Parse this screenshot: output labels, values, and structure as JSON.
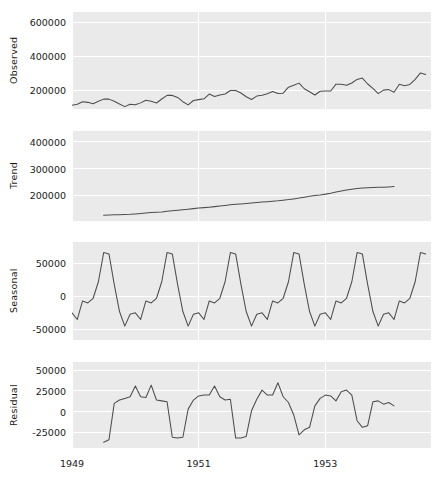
{
  "chart_data": {
    "type": "line",
    "title": "",
    "subtitle": "",
    "xlabel": "",
    "layout": {
      "panels": 4,
      "grid": true,
      "grid_color": "#ffffff",
      "panel_background": "#eaeaea",
      "line_color": "#4d4d4d",
      "legend": "none",
      "figure_background": "#ffffff"
    },
    "x": {
      "tick_labels": [
        "1949",
        "1951",
        "1953"
      ],
      "tick_values": [
        1949,
        1951,
        1953
      ],
      "range": [
        1949.0,
        1954.67
      ],
      "unit": "year",
      "frequency": "monthly",
      "n_points": 68,
      "start": "1949-01",
      "end": "1954-08"
    },
    "panels": [
      {
        "name": "Observed",
        "ylabel": "Observed",
        "ytick_labels": [
          "200000",
          "400000",
          "600000"
        ],
        "ytick_values": [
          200000,
          400000,
          600000
        ],
        "ylim": [
          90000,
          660000
        ],
        "values": [
          112000,
          118000,
          132000,
          129000,
          121000,
          135000,
          148000,
          148000,
          136000,
          119000,
          104000,
          118000,
          115000,
          126000,
          141000,
          135000,
          125000,
          149000,
          170000,
          170000,
          158000,
          133000,
          114000,
          140000,
          145000,
          150000,
          178000,
          163000,
          172000,
          178000,
          199000,
          199000,
          184000,
          162000,
          146000,
          166000,
          171000,
          180000,
          193000,
          181000,
          183000,
          218000,
          230000,
          242000,
          209000,
          191000,
          172000,
          194000,
          196000,
          196000,
          236000,
          235000,
          229000,
          243000,
          264000,
          272000,
          237000,
          211000,
          180000,
          201000,
          204000,
          188000,
          235000,
          227000,
          234000,
          264000,
          302000,
          293000
        ]
      },
      {
        "name": "Trend",
        "ylabel": "Trend",
        "ytick_labels": [
          "200000",
          "300000",
          "400000"
        ],
        "ytick_values": [
          200000,
          300000,
          400000
        ],
        "ylim": [
          105000,
          440000
        ],
        "start_index": 6,
        "end_index": 61,
        "values": [
          126666,
          127250,
          127958,
          128583,
          129000,
          129750,
          131250,
          133083,
          134916,
          136416,
          137416,
          138750,
          140916,
          143166,
          145083,
          147125,
          148916,
          151041,
          153041,
          154791,
          156500,
          158500,
          160875,
          163000,
          165500,
          167125,
          168500,
          170125,
          172000,
          174000,
          175666,
          177000,
          178416,
          180125,
          182541,
          184666,
          187250,
          190250,
          193791,
          197000,
          199750,
          202166,
          205000,
          208666,
          212833,
          216500,
          220250,
          223250,
          225833,
          227666,
          229000,
          229833,
          230333,
          230916,
          231833,
          233083
        ]
      },
      {
        "name": "Seasonal",
        "ylabel": "Seasonal",
        "ytick_labels": [
          "-50000",
          "0",
          "50000"
        ],
        "ytick_values": [
          -50000,
          0,
          50000
        ],
        "ylim": [
          -66000,
          82000
        ],
        "period": 12,
        "pattern": [
          -25000,
          -35000,
          -7000,
          -10000,
          -3000,
          22000,
          66000,
          64000,
          18000,
          -23000,
          -45000,
          -27000
        ],
        "description": "Repeating 12-month seasonal component, peak in July/August, trough in November"
      },
      {
        "name": "Residual",
        "ylabel": "Residual",
        "ytick_labels": [
          "-25000",
          "0",
          "25000",
          "50000"
        ],
        "ytick_values": [
          -25000,
          0,
          25000,
          50000
        ],
        "ylim": [
          -44000,
          60000
        ],
        "start_index": 6,
        "end_index": 61,
        "values": [
          -37000,
          -34000,
          10000,
          14000,
          16000,
          18000,
          31000,
          18000,
          17000,
          32000,
          14000,
          13000,
          12000,
          -31000,
          -32000,
          -31000,
          3000,
          14000,
          19000,
          20000,
          20000,
          31000,
          18000,
          14000,
          15000,
          -32000,
          -32000,
          -30000,
          1000,
          15000,
          26000,
          20000,
          20000,
          35000,
          18000,
          11000,
          -4000,
          -28000,
          -22000,
          -19000,
          7000,
          16000,
          20000,
          19000,
          13000,
          24000,
          26000,
          20000,
          -11000,
          -19000,
          -17000,
          12000,
          13000,
          9000,
          11000,
          7000
        ]
      }
    ]
  }
}
